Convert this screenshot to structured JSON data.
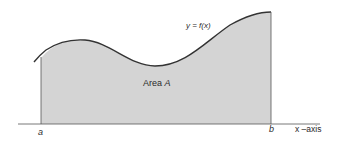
{
  "diagram": {
    "curve_label": "y = f(x)",
    "area_label": "Area",
    "area_symbol": "A",
    "lower_bound_label": "a",
    "upper_bound_label": "b",
    "axis_label": "x –axis",
    "colors": {
      "fill": "#d4d4d4",
      "stroke": "#333333",
      "axis": "#555555",
      "text": "#2a2a2a",
      "background": "#ffffff"
    }
  }
}
